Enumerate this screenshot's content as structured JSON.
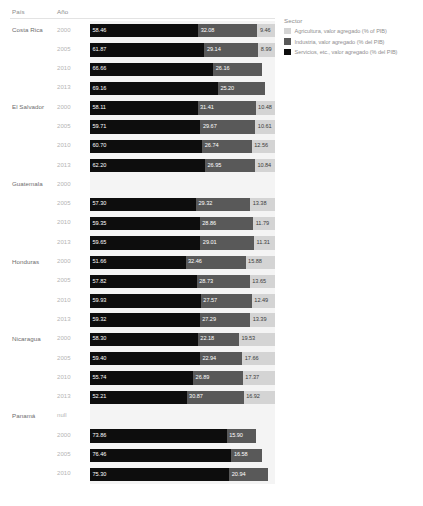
{
  "table_headers": {
    "country": "País",
    "year": "Año"
  },
  "legend": {
    "title": "Sector",
    "items": [
      {
        "label": "Agricultura, valor agregado (% of PIB)",
        "color": "#d4d4d4",
        "key": "agricultura"
      },
      {
        "label": "Industria, valor agregado (% del PIB)",
        "color": "#595959",
        "key": "industria"
      },
      {
        "label": "Servicios, etc., valor agregado (% del PIB)",
        "color": "#0d0d0d",
        "key": "servicios"
      }
    ]
  },
  "colors": {
    "servicios": "#0d0d0d",
    "industria": "#595959",
    "agricultura": "#d4d4d4",
    "band_background": "#f4f4f4",
    "page_background": "#ffffff",
    "header_text": "#8c8c8c",
    "country_text": "#6e6e6e",
    "year_text": "#b4b4b4"
  },
  "chart_data": {
    "type": "bar",
    "orientation": "horizontal",
    "stacked": true,
    "title": "",
    "xlabel": "",
    "ylabel": "",
    "xlim": [
      0,
      100
    ],
    "grid": false,
    "legend_position": "right",
    "series": [
      {
        "name": "Servicios, etc., valor agregado (% del PIB)",
        "color": "#0d0d0d"
      },
      {
        "name": "Industria, valor agregado (% del PIB)",
        "color": "#595959"
      },
      {
        "name": "Agricultura, valor agregado (% of PIB)",
        "color": "#d4d4d4"
      }
    ],
    "rows": [
      {
        "country": "Costa Rica",
        "year": "2000",
        "servicios": 58.46,
        "industria": 32.08,
        "agricultura": 9.46,
        "servicios_label": "58.46",
        "industria_label": "32.08",
        "agricultura_label": "9.46"
      },
      {
        "country": "",
        "year": "2005",
        "servicios": 61.87,
        "industria": 29.14,
        "agricultura": 8.99,
        "servicios_label": "61.87",
        "industria_label": "29.14",
        "agricultura_label": "8.99"
      },
      {
        "country": "",
        "year": "2010",
        "servicios": 66.66,
        "industria": 26.16,
        "agricultura": null,
        "servicios_label": "66.66",
        "industria_label": "26.16",
        "agricultura_label": ""
      },
      {
        "country": "",
        "year": "2013",
        "servicios": 69.16,
        "industria": 25.2,
        "agricultura": null,
        "servicios_label": "69.16",
        "industria_label": "25.20",
        "agricultura_label": ""
      },
      {
        "country": "El Salvador",
        "year": "2000",
        "servicios": 58.11,
        "industria": 31.41,
        "agricultura": 10.48,
        "servicios_label": "58.11",
        "industria_label": "31.41",
        "agricultura_label": "10.48"
      },
      {
        "country": "",
        "year": "2005",
        "servicios": 59.71,
        "industria": 29.67,
        "agricultura": 10.61,
        "servicios_label": "59.71",
        "industria_label": "29.67",
        "agricultura_label": "10.61"
      },
      {
        "country": "",
        "year": "2010",
        "servicios": 60.7,
        "industria": 26.74,
        "agricultura": 12.56,
        "servicios_label": "60.70",
        "industria_label": "26.74",
        "agricultura_label": "12.56"
      },
      {
        "country": "",
        "year": "2013",
        "servicios": 62.2,
        "industria": 26.95,
        "agricultura": 10.84,
        "servicios_label": "62.20",
        "industria_label": "26.95",
        "agricultura_label": "10.84"
      },
      {
        "country": "Guatemala",
        "year": "2000",
        "servicios": null,
        "industria": null,
        "agricultura": null,
        "servicios_label": "",
        "industria_label": "",
        "agricultura_label": "",
        "blank": true
      },
      {
        "country": "",
        "year": "2005",
        "servicios": 57.3,
        "industria": 29.32,
        "agricultura": 13.38,
        "servicios_label": "57.30",
        "industria_label": "29.32",
        "agricultura_label": "13.38"
      },
      {
        "country": "",
        "year": "2010",
        "servicios": 59.35,
        "industria": 28.86,
        "agricultura": 11.79,
        "servicios_label": "59.35",
        "industria_label": "28.86",
        "agricultura_label": "11.79"
      },
      {
        "country": "",
        "year": "2013",
        "servicios": 59.65,
        "industria": 29.01,
        "agricultura": 11.31,
        "servicios_label": "59.65",
        "industria_label": "29.01",
        "agricultura_label": "11.31"
      },
      {
        "country": "Honduras",
        "year": "2000",
        "servicios": 51.66,
        "industria": 32.46,
        "agricultura": 15.88,
        "servicios_label": "51.66",
        "industria_label": "32.46",
        "agricultura_label": "15.88"
      },
      {
        "country": "",
        "year": "2005",
        "servicios": 57.82,
        "industria": 28.73,
        "agricultura": 13.65,
        "servicios_label": "57.82",
        "industria_label": "28.73",
        "agricultura_label": "13.65"
      },
      {
        "country": "",
        "year": "2010",
        "servicios": 59.93,
        "industria": 27.57,
        "agricultura": 12.49,
        "servicios_label": "59.93",
        "industria_label": "27.57",
        "agricultura_label": "12.49"
      },
      {
        "country": "",
        "year": "2013",
        "servicios": 59.32,
        "industria": 27.29,
        "agricultura": 13.39,
        "servicios_label": "59.32",
        "industria_label": "27.29",
        "agricultura_label": "13.39"
      },
      {
        "country": "Nicaragua",
        "year": "2000",
        "servicios": 58.3,
        "industria": 22.18,
        "agricultura": 19.53,
        "servicios_label": "58.30",
        "industria_label": "22.18",
        "agricultura_label": "19.53"
      },
      {
        "country": "",
        "year": "2005",
        "servicios": 59.4,
        "industria": 22.94,
        "agricultura": 17.66,
        "servicios_label": "59.40",
        "industria_label": "22.94",
        "agricultura_label": "17.66"
      },
      {
        "country": "",
        "year": "2010",
        "servicios": 55.74,
        "industria": 26.89,
        "agricultura": 17.37,
        "servicios_label": "55.74",
        "industria_label": "26.89",
        "agricultura_label": "17.37"
      },
      {
        "country": "",
        "year": "2013",
        "servicios": 52.21,
        "industria": 30.87,
        "agricultura": 16.92,
        "servicios_label": "52.21",
        "industria_label": "30.87",
        "agricultura_label": "16.92"
      },
      {
        "country": "Panamá",
        "year": "null",
        "servicios": null,
        "industria": null,
        "agricultura": null,
        "servicios_label": "",
        "industria_label": "",
        "agricultura_label": "",
        "blank": true
      },
      {
        "country": "",
        "year": "2000",
        "servicios": 73.86,
        "industria": 15.9,
        "agricultura": null,
        "servicios_label": "73.86",
        "industria_label": "15.90",
        "agricultura_label": ""
      },
      {
        "country": "",
        "year": "2005",
        "servicios": 76.46,
        "industria": 16.58,
        "agricultura": null,
        "servicios_label": "76.46",
        "industria_label": "16.58",
        "agricultura_label": ""
      },
      {
        "country": "",
        "year": "2010",
        "servicios": 75.3,
        "industria": 20.94,
        "agricultura": null,
        "servicios_label": "75.30",
        "industria_label": "20.94",
        "agricultura_label": ""
      }
    ]
  }
}
